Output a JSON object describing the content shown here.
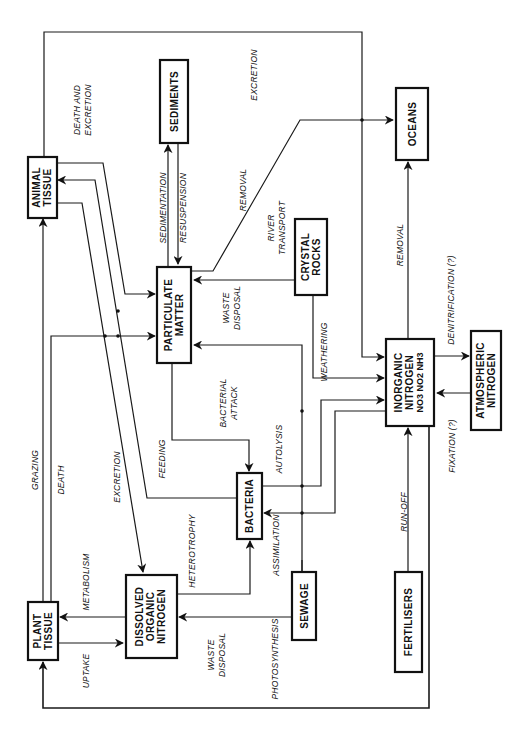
{
  "nodes": {
    "animal_tissue": [
      "ANIMAL",
      "TISSUE"
    ],
    "sediments": [
      "SEDIMENTS"
    ],
    "oceans": [
      "OCEANS"
    ],
    "particulate_matter": [
      "PARTICULATE",
      "MATTER"
    ],
    "crystal_rocks": [
      "CRYSTAL",
      "ROCKS"
    ],
    "inorganic_nitrogen": [
      "INORGANIC",
      "NITROGEN",
      "NO3  NO2  NH3"
    ],
    "atmospheric_nitrogen": [
      "ATMOSPHERIC",
      "NITROGEN"
    ],
    "bacteria": [
      "BACTERIA"
    ],
    "dissolved_organic_nitrogen": [
      "DISSOLVED",
      "ORGANIC",
      "NITROGEN"
    ],
    "plant_tissue": [
      "PLANT",
      "TISSUE"
    ],
    "sewage": [
      "SEWAGE"
    ],
    "fertilisers": [
      "FERTILISERS"
    ]
  },
  "flows": {
    "death_and_excretion": [
      "DEATH  AND",
      "EXCRETION"
    ],
    "excretion_top": "EXCRETION",
    "sedimentation": "SEDIMENTATION",
    "resuspension": "RESUSPENSION",
    "removal_particulate": "REMOVAL",
    "river_transport": [
      "RIVER",
      "TRANSPORT"
    ],
    "removal_inorganic": "REMOVAL",
    "waste_disposal_pm": [
      "WASTE",
      "DISPOSAL"
    ],
    "weathering": "WEATHERING",
    "denitrification": "DENITRIFICATION (?)",
    "fixation": "FIXATION (?)",
    "bacterial_attack": [
      "BACTERIAL",
      "ATTACK"
    ],
    "autolysis": "AUTOLYSIS",
    "feeding": "FEEDING",
    "grazing": "GRAZING",
    "death": "DEATH",
    "excretion_mid": "EXCRETION",
    "metabolism": "METABOLISM",
    "heterotrophy": "HETEROTROPHY",
    "assimilation": "ASSIMILATION",
    "run_off": "RUN-OFF",
    "uptake": "UPTAKE",
    "waste_disposal_don": [
      "WASTE",
      "DISPOSAL"
    ],
    "photosynthesis": "PHOTOSYNTHESIS"
  }
}
